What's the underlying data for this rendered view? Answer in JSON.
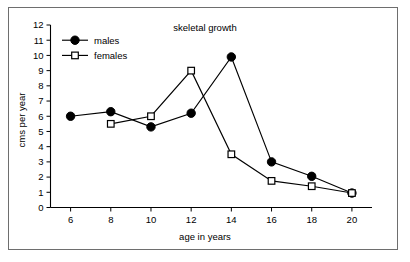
{
  "chart_data": {
    "type": "line",
    "title": "skeletal growth",
    "xlabel": "age in years",
    "ylabel": "cms per year",
    "x": [
      6,
      8,
      10,
      12,
      14,
      16,
      18,
      20
    ],
    "xlim": [
      5,
      21
    ],
    "ylim": [
      0,
      12
    ],
    "xticks": [
      "6",
      "8",
      "10",
      "12",
      "14",
      "16",
      "18",
      "20"
    ],
    "yticks": [
      "0",
      "1",
      "2",
      "3",
      "4",
      "5",
      "6",
      "7",
      "8",
      "9",
      "10",
      "11",
      "12"
    ],
    "grid": false,
    "legend_position": "upper-left-inside",
    "series": [
      {
        "name": "males",
        "marker": "filled-circle",
        "x": [
          6,
          8,
          10,
          12,
          14,
          16,
          18,
          20
        ],
        "values": [
          6.0,
          6.3,
          5.3,
          6.2,
          9.9,
          3.0,
          2.05,
          0.95
        ]
      },
      {
        "name": "females",
        "marker": "open-square",
        "x": [
          8,
          10,
          12,
          14,
          16,
          18,
          20
        ],
        "values": [
          5.5,
          6.0,
          9.0,
          3.5,
          1.75,
          1.4,
          0.95
        ]
      }
    ]
  },
  "legend": {
    "items": [
      {
        "label": "males"
      },
      {
        "label": "females"
      }
    ]
  },
  "colors": {
    "ink": "#000000",
    "frame": "#6e6e6e",
    "background": "#ffffff"
  }
}
